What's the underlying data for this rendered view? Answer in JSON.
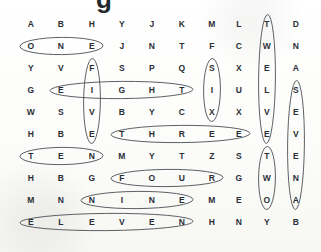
{
  "document": {
    "kind": "word-search-puzzle",
    "title_partial": "g",
    "background_color": "#fdfdfc",
    "letter_color": "#2a2f35",
    "mark_color": "#4a4f55"
  },
  "grid": {
    "columns": 10,
    "rows": 10,
    "col_x": [
      31,
      61,
      92,
      122,
      152,
      182,
      212,
      239,
      267,
      296
    ],
    "row_y": [
      24,
      46,
      68,
      90,
      112,
      134,
      156,
      178,
      200,
      222
    ],
    "letters": [
      [
        "A",
        "B",
        "H",
        "Y",
        "J",
        "K",
        "M",
        "L",
        "T",
        "D"
      ],
      [
        "O",
        "N",
        "E",
        "J",
        "N",
        "T",
        "F",
        "C",
        "W",
        "N"
      ],
      [
        "Y",
        "V",
        "F",
        "S",
        "P",
        "Q",
        "S",
        "X",
        "E",
        "A"
      ],
      [
        "G",
        "E",
        "I",
        "G",
        "H",
        "T",
        "I",
        "U",
        "L",
        "S"
      ],
      [
        "W",
        "S",
        "V",
        "B",
        "Y",
        "C",
        "X",
        "X",
        "V",
        "E"
      ],
      [
        "H",
        "B",
        "E",
        "T",
        "H",
        "R",
        "E",
        "E",
        "E",
        "V"
      ],
      [
        "T",
        "E",
        "N",
        "M",
        "Y",
        "T",
        "Z",
        "S",
        "T",
        "E"
      ],
      [
        "H",
        "B",
        "G",
        "F",
        "O",
        "U",
        "R",
        "G",
        "W",
        "N"
      ],
      [
        "M",
        "N",
        "N",
        "I",
        "N",
        "E",
        "M",
        "E",
        "O",
        "A"
      ],
      [
        "E",
        "L",
        "E",
        "V",
        "E",
        "N",
        "H",
        "N",
        "Y",
        "B"
      ]
    ]
  },
  "found_words": [
    {
      "word": "ONE",
      "direction": "horizontal",
      "row": 1,
      "col_start": 0,
      "col_end": 2
    },
    {
      "word": "EIGHT",
      "direction": "horizontal",
      "row": 3,
      "col_start": 1,
      "col_end": 5
    },
    {
      "word": "THREE",
      "direction": "horizontal",
      "row": 5,
      "col_start": 3,
      "col_end": 7
    },
    {
      "word": "TEN",
      "direction": "horizontal",
      "row": 6,
      "col_start": 0,
      "col_end": 2
    },
    {
      "word": "FOUR",
      "direction": "horizontal",
      "row": 7,
      "col_start": 3,
      "col_end": 6
    },
    {
      "word": "NINE",
      "direction": "horizontal",
      "row": 8,
      "col_start": 2,
      "col_end": 5
    },
    {
      "word": "ELEVEN",
      "direction": "horizontal",
      "row": 9,
      "col_start": 0,
      "col_end": 5
    },
    {
      "word": "FIVE",
      "direction": "vertical",
      "col": 2,
      "row_start": 2,
      "row_end": 5
    },
    {
      "word": "SIX",
      "direction": "vertical",
      "col": 6,
      "row_start": 2,
      "row_end": 4
    },
    {
      "word": "TWELVE",
      "direction": "vertical",
      "col": 8,
      "row_start": 0,
      "row_end": 5
    },
    {
      "word": "TWO",
      "direction": "vertical",
      "col": 8,
      "row_start": 6,
      "row_end": 8
    },
    {
      "word": "SEVEN",
      "direction": "vertical",
      "col": 9,
      "row_start": 3,
      "row_end": 8
    }
  ]
}
